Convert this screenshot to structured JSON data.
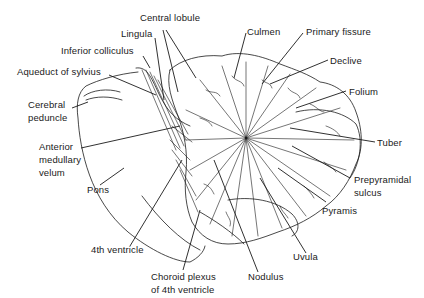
{
  "diagram": {
    "labels": [
      {
        "id": "central-lobule",
        "text": "Central lobule",
        "x": 140,
        "y": 18
      },
      {
        "id": "lingula",
        "text": "Lingula",
        "x": 121,
        "y": 30
      },
      {
        "id": "inferior-colliculus",
        "text": "Inferior colliculus",
        "x": 61,
        "y": 46
      },
      {
        "id": "aqueduct-of-sylvius",
        "text": "Aqueduct of sylvius",
        "x": 17,
        "y": 67
      },
      {
        "id": "cerebral-peduncle-1",
        "text": "Cerebral",
        "x": 28,
        "y": 100
      },
      {
        "id": "cerebral-peduncle-2",
        "text": "peduncle",
        "x": 28,
        "y": 113
      },
      {
        "id": "anterior-medullary-velum-1",
        "text": "Anterior",
        "x": 39,
        "y": 141
      },
      {
        "id": "anterior-medullary-velum-2",
        "text": "medullary",
        "x": 39,
        "y": 154
      },
      {
        "id": "anterior-medullary-velum-3",
        "text": "velum",
        "x": 39,
        "y": 167
      },
      {
        "id": "pons",
        "text": "Pons",
        "x": 87,
        "y": 185
      },
      {
        "id": "4th-ventricle",
        "text": "4th ventricle",
        "x": 91,
        "y": 246
      },
      {
        "id": "choroid-plexus-1",
        "text": "Choroid plexus",
        "x": 151,
        "y": 271
      },
      {
        "id": "choroid-plexus-2",
        "text": "of 4th ventricle",
        "x": 151,
        "y": 284
      },
      {
        "id": "nodulus",
        "text": "Nodulus",
        "x": 248,
        "y": 271
      },
      {
        "id": "uvula",
        "text": "Uvula",
        "x": 293,
        "y": 252
      },
      {
        "id": "pyramis",
        "text": "Pyramis",
        "x": 322,
        "y": 207
      },
      {
        "id": "prepyramidal-sulcus-1",
        "text": "Prepyramidal",
        "x": 354,
        "y": 175
      },
      {
        "id": "prepyramidal-sulcus-2",
        "text": "sulcus",
        "x": 354,
        "y": 188
      },
      {
        "id": "tuber",
        "text": "Tuber",
        "x": 377,
        "y": 137
      },
      {
        "id": "folium",
        "text": "Folium",
        "x": 349,
        "y": 86
      },
      {
        "id": "declive",
        "text": "Declive",
        "x": 330,
        "y": 55
      },
      {
        "id": "primary-fissure",
        "text": "Primary fissure",
        "x": 306,
        "y": 26
      },
      {
        "id": "culmen",
        "text": "Culmen",
        "x": 247,
        "y": 26
      }
    ],
    "colors": {
      "ink": "#1a1a1a",
      "paper": "#ffffff"
    }
  }
}
